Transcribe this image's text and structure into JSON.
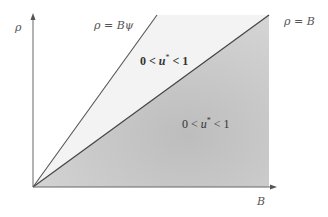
{
  "diagram": {
    "title": "",
    "axes": {
      "y_label": "ρ",
      "x_label": "B"
    },
    "lines": [
      {
        "id": "steep",
        "label": "ρ = Bψ"
      },
      {
        "id": "diagonal",
        "label": "ρ = B"
      }
    ],
    "regions": [
      {
        "id": "between-lines",
        "label": "0 < u* < 1",
        "expr_pre": "0 < ",
        "var": "u",
        "sup": "*",
        "expr_post": " < 1"
      },
      {
        "id": "below-diagonal",
        "label": "0 < u* < 1",
        "expr_pre": "0 < ",
        "var": "u",
        "sup": "*",
        "expr_post": " < 1"
      }
    ],
    "colors": {
      "axis": "#666666",
      "line": "#555555",
      "shade_dark": "#c8c8c8",
      "shade_light": "#f2f2f2"
    }
  }
}
